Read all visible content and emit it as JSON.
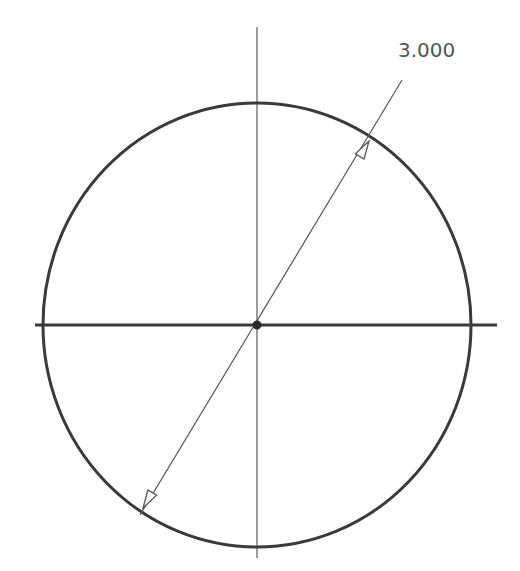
{
  "drawing": {
    "type": "circle-sketch",
    "dimension": {
      "label": "3.000",
      "type": "diameter"
    },
    "geometry": {
      "center": [
        257,
        325
      ],
      "radius_x": 214,
      "radius_y": 222,
      "horizontal_axis": [
        [
          35,
          325
        ],
        [
          497,
          325
        ]
      ],
      "vertical_axis": [
        [
          257,
          27
        ],
        [
          257,
          558
        ]
      ],
      "diameter_line": [
        [
          140,
          515
        ],
        [
          402,
          80
        ]
      ],
      "label_position": [
        398,
        57
      ]
    },
    "colors": {
      "circle": "#3a3a3a",
      "axis_horizontal": "#3a3a3a",
      "axis_vertical": "#6a6a6a",
      "dimension_line": "#555555",
      "text": "#555555",
      "background": "#ffffff"
    }
  }
}
